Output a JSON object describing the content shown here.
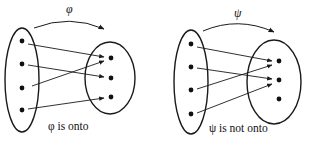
{
  "diagrams": [
    {
      "map_symbol": "φ",
      "caption": "φ is onto",
      "domain_points": 4,
      "codomain_points": 3,
      "mapping": [
        [
          1,
          1
        ],
        [
          2,
          2
        ],
        [
          3,
          1
        ],
        [
          4,
          3
        ]
      ],
      "surjective": true
    },
    {
      "map_symbol": "ψ",
      "caption": "ψ is not onto",
      "domain_points": 4,
      "codomain_points": 3,
      "mapping": [
        [
          1,
          1
        ],
        [
          2,
          2
        ],
        [
          3,
          1
        ],
        [
          4,
          2
        ]
      ],
      "surjective": false
    }
  ],
  "colors": {
    "stroke": "#1a1a1a",
    "text": "#111111",
    "background": "#ffffff"
  }
}
